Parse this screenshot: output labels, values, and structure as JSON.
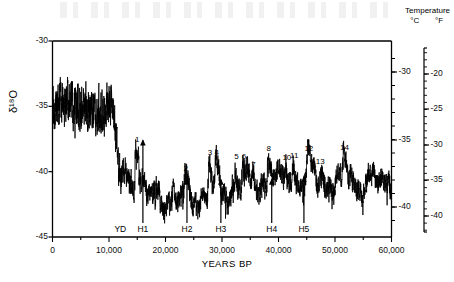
{
  "chart_data": {
    "type": "line",
    "title": "",
    "xlabel": "YEARS BP",
    "ylabel": "δ¹⁸O",
    "xlim": [
      0,
      60000
    ],
    "ylim": [
      -45,
      -30
    ],
    "grid": false,
    "legend": null,
    "x_ticks_major": [
      0,
      10000,
      20000,
      30000,
      40000,
      50000,
      60000
    ],
    "x_ticklabels": [
      "0",
      "10,000",
      "20,000",
      "30,000",
      "40,000",
      "50,000",
      "60,000"
    ],
    "x_ticks_minor_step": 5000,
    "y_ticks": [
      -30,
      -35,
      -40,
      -45
    ],
    "y_ticklabels": [
      "-30",
      "-35",
      "-40",
      "-45"
    ],
    "secondary_axes": [
      {
        "name": "temperature-celsius",
        "unit": "°C",
        "ticks": [
          -30,
          -35,
          -40
        ],
        "ticklabels": [
          "-30",
          "-35",
          "-40"
        ],
        "positions_y_px": [
          72,
          140,
          207
        ],
        "minor_step": 1
      },
      {
        "name": "temperature-fahrenheit",
        "unit": "°F",
        "ticks": [
          -20,
          -25,
          -30,
          -35,
          -40
        ],
        "ticklabels": [
          "-20",
          "-25",
          "-30",
          "-35",
          "-40"
        ],
        "positions_y_px": [
          74,
          109,
          145,
          180,
          216
        ],
        "minor_step": 1
      }
    ],
    "secondary_axis_title": "Temperature",
    "series": [
      {
        "name": "GISP2 δ¹⁸O",
        "color": "#000000",
        "description": "Greenland ice core oxygen isotope record: Holocene plateau near -35 permil, abrupt drop across the deglaciation, glacial interval near -40 to -42 permil with Dansgaard-Oeschger interstadial spikes."
      }
    ],
    "annotations_interstadials": [
      {
        "label": "1",
        "x": 14800,
        "y": -38.2
      },
      {
        "label": "2",
        "x": 23400,
        "y": -40.4
      },
      {
        "label": "3",
        "x": 27700,
        "y": -39.2
      },
      {
        "label": "4",
        "x": 28900,
        "y": -39.2
      },
      {
        "label": "5",
        "x": 32400,
        "y": -39.5
      },
      {
        "label": "6",
        "x": 33700,
        "y": -39.5
      },
      {
        "label": "7",
        "x": 35400,
        "y": -40.1
      },
      {
        "label": "8",
        "x": 38100,
        "y": -38.9
      },
      {
        "label": "9",
        "x": 40100,
        "y": -40.6
      },
      {
        "label": "10",
        "x": 41300,
        "y": -39.6
      },
      {
        "label": "11",
        "x": 42600,
        "y": -39.4
      },
      {
        "label": "12",
        "x": 45200,
        "y": -38.9
      },
      {
        "label": "13",
        "x": 47200,
        "y": -39.9
      },
      {
        "label": "14",
        "x": 51500,
        "y": -38.8
      }
    ],
    "annotations_events": [
      {
        "label": "YD",
        "x": 12000,
        "arrow": false
      },
      {
        "label": "H1",
        "x": 16000,
        "arrow": true,
        "arrow_top_y": -37.6
      },
      {
        "label": "H2",
        "x": 23800,
        "arrow": true,
        "arrow_top_y": -40.6
      },
      {
        "label": "H3",
        "x": 29800,
        "arrow": true,
        "arrow_top_y": -40.6
      },
      {
        "label": "H4",
        "x": 38800,
        "arrow": true,
        "arrow_top_y": -40.6
      },
      {
        "label": "H5",
        "x": 44500,
        "arrow": true,
        "arrow_top_y": -40.4
      }
    ]
  },
  "axes": {
    "y_left": {
      "title": "δ¹⁸O",
      "labels": [
        "-30",
        "-35",
        "-40",
        "-45"
      ]
    },
    "x_bottom": {
      "title": "YEARS BP",
      "labels": [
        "0",
        "10,000",
        "20,000",
        "30,000",
        "40,000",
        "50,000",
        "60,000"
      ]
    },
    "right_header": {
      "title": "Temperature",
      "unit_c": "°C",
      "unit_f": "°F"
    },
    "y_right_c": {
      "labels": [
        "-30",
        "-35",
        "-40"
      ]
    },
    "y_right_f": {
      "labels": [
        "-20",
        "-25",
        "-30",
        "-35",
        "-40"
      ]
    }
  },
  "events": {
    "yd": "YD",
    "h1": "H1",
    "h2": "H2",
    "h3": "H3",
    "h4": "H4",
    "h5": "H5"
  },
  "interstadials": {
    "n1": "1",
    "n2": "2",
    "n3": "3",
    "n4": "4",
    "n5": "5",
    "n6": "6",
    "n7": "7",
    "n8": "8",
    "n9": "9",
    "n10": "10",
    "n11": "11",
    "n12": "12",
    "n13": "13",
    "n14": "14"
  },
  "colors": {
    "curve": "#000000",
    "axis": "#000000",
    "text": "#111111",
    "background": "#ffffff"
  }
}
